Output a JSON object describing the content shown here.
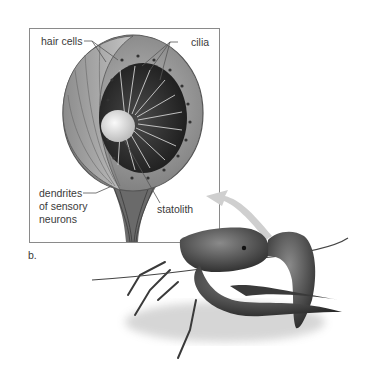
{
  "figure": {
    "panel_label": "b.",
    "inset_title": "Statocyst",
    "labels": {
      "hair_cells": "hair cells",
      "cilia": "cilia",
      "dendrites_line1": "dendrites",
      "dendrites_line2": "of sensory",
      "dendrites_line3": "neurons",
      "statolith": "statolith"
    },
    "colors": {
      "background": "#ffffff",
      "box_border": "#8a8a8a",
      "arrow": "#c9c9c9",
      "label_text": "#3a3a3a",
      "cell_fill": "#9a9a9a",
      "cavity_fill": "#2e2e2e",
      "statolith_fill": "#e6e6e6"
    }
  }
}
